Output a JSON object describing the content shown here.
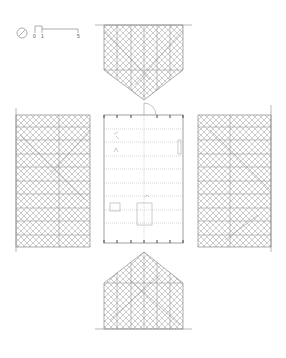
{
  "drawing": {
    "type": "architectural orthographic projection (unfolded elevations around floor plan)",
    "colors": {
      "background": "#ffffff",
      "line": "#7a7a7a",
      "hatch": "#9a9a9a",
      "dark": "#444444"
    }
  },
  "legend": {
    "north_arrow": "north-arrow",
    "scale_bar": {
      "ticks": [
        "0",
        "1",
        "5"
      ]
    }
  },
  "views": [
    {
      "id": "top-elevation",
      "shape": "pentagon pointing down"
    },
    {
      "id": "left-elevation",
      "shape": "rectangle"
    },
    {
      "id": "floor-plan",
      "shape": "rectangle with column grid and door swing"
    },
    {
      "id": "right-elevation",
      "shape": "rectangle"
    },
    {
      "id": "bottom-elevation",
      "shape": "pentagon pointing up"
    }
  ]
}
